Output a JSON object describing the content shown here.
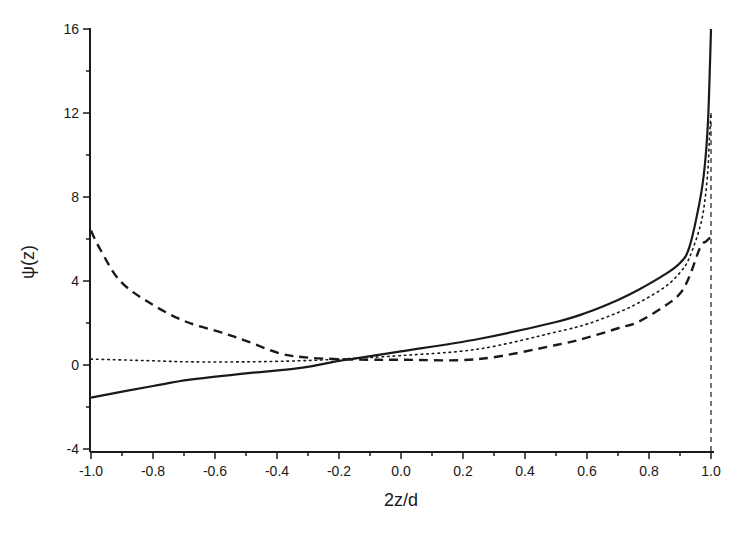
{
  "chart_data": {
    "type": "line",
    "title": "",
    "xlabel": "2z/d",
    "ylabel": "ψ(z)",
    "xlim": [
      -1.0,
      1.0
    ],
    "ylim": [
      -4,
      16
    ],
    "grid": false,
    "legend": null,
    "x_ticks": [
      -1.0,
      -0.8,
      -0.6,
      -0.4,
      -0.2,
      0.0,
      0.2,
      0.4,
      0.6,
      0.8,
      1.0
    ],
    "x_tick_labels": [
      "-1.0",
      "-0.8",
      "-0.6",
      "-0.4",
      "-0.2",
      "0.0",
      "0.2",
      "0.4",
      "0.6",
      "0.8",
      "1.0"
    ],
    "y_ticks": [
      -4,
      0,
      4,
      8,
      12,
      16
    ],
    "y_tick_labels": [
      "-4",
      "0",
      "4",
      "8",
      "12",
      "16"
    ],
    "y_minor_ticks": [
      -2,
      2,
      6,
      10,
      14
    ],
    "x_minor_ticks": [
      -0.9,
      -0.7,
      -0.5,
      -0.3,
      -0.1,
      0.1,
      0.3,
      0.5,
      0.7,
      0.9
    ],
    "series": [
      {
        "name": "solid",
        "style": "solid",
        "x": [
          -1.0,
          -0.8,
          -0.68,
          -0.5,
          -0.33,
          -0.2,
          -0.15,
          0.0,
          0.25,
          0.5,
          0.6,
          0.7,
          0.765,
          0.85,
          0.9,
          0.93,
          0.965,
          0.98,
          0.99,
          0.995,
          1.0
        ],
        "y": [
          -1.55,
          -1.0,
          -0.7,
          -0.4,
          -0.15,
          0.2,
          0.3,
          0.65,
          1.24,
          2.05,
          2.5,
          3.1,
          3.57,
          4.3,
          4.86,
          5.6,
          7.9,
          9.5,
          11.5,
          13.5,
          16.0
        ]
      },
      {
        "name": "dotted",
        "style": "dotted",
        "x": [
          -1.0,
          -0.8,
          -0.68,
          -0.5,
          -0.33,
          -0.2,
          0.0,
          0.25,
          0.5,
          0.6,
          0.7,
          0.765,
          0.85,
          0.9,
          0.93,
          0.965,
          0.98,
          0.99,
          0.995,
          1.0
        ],
        "y": [
          0.28,
          0.2,
          0.15,
          0.15,
          0.2,
          0.28,
          0.45,
          0.76,
          1.57,
          1.95,
          2.5,
          2.95,
          3.7,
          4.4,
          5.1,
          6.6,
          7.8,
          9.3,
          10.8,
          12.0
        ]
      },
      {
        "name": "dashed",
        "style": "dashed",
        "x": [
          -1.0,
          -0.97,
          -0.906,
          -0.81,
          -0.7,
          -0.58,
          -0.5,
          -0.39,
          -0.3,
          -0.2,
          -0.1,
          0.0,
          0.25,
          0.5,
          0.6,
          0.7,
          0.765,
          0.85,
          0.9,
          0.93,
          0.965,
          0.985,
          1.0
        ],
        "y": [
          6.4,
          5.5,
          4.0,
          2.95,
          2.1,
          1.55,
          1.15,
          0.55,
          0.35,
          0.28,
          0.25,
          0.25,
          0.28,
          0.95,
          1.3,
          1.75,
          2.05,
          2.8,
          3.4,
          4.2,
          5.6,
          5.9,
          6.1
        ]
      }
    ],
    "annotations": [
      {
        "type": "vertical_line",
        "x": 1.0,
        "style": "thin-dashed",
        "y_from": -4,
        "y_to": 12
      }
    ]
  },
  "colors": {
    "background": "#ffffff",
    "ink": "#1a1a1a"
  }
}
